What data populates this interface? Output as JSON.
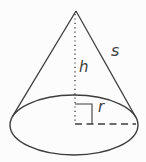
{
  "diagram": {
    "labels": {
      "slant_height": "s",
      "height": "h",
      "radius": "r"
    },
    "line_color": "#3d3d3d",
    "background_color": "#fcfcfc"
  }
}
